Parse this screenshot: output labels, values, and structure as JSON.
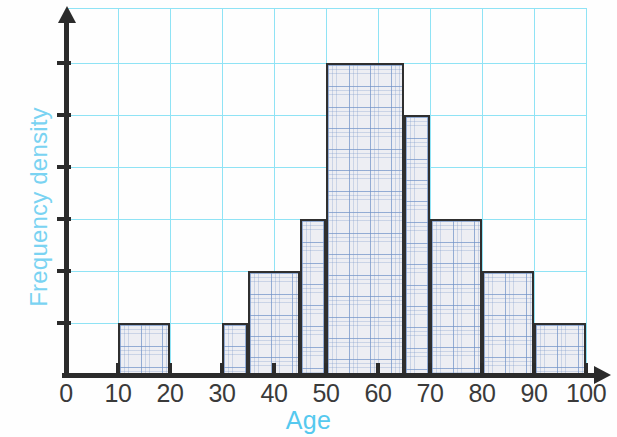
{
  "chart_data": {
    "type": "bar",
    "title": "",
    "subtitle": "",
    "xlabel": "Age",
    "ylabel": "Frequency density",
    "xlim": [
      0,
      100
    ],
    "ylim": [
      0,
      7
    ],
    "grid": true,
    "legend": null,
    "xticks": [
      "0",
      "10",
      "20",
      "30",
      "40",
      "50",
      "60",
      "70",
      "80",
      "90",
      "100"
    ],
    "xtick_values": [
      0,
      10,
      20,
      30,
      40,
      50,
      60,
      70,
      80,
      90,
      100
    ],
    "yticks": [
      "",
      "",
      "",
      "",
      "",
      ""
    ],
    "ytick_values": [
      1,
      2,
      3,
      4,
      5,
      6
    ],
    "bin_edges": [
      10,
      20,
      30,
      35,
      45,
      50,
      65,
      70,
      80,
      90,
      100
    ],
    "bars": [
      {
        "label": "10-20",
        "x0": 10,
        "x1": 20,
        "height": 1
      },
      {
        "label": "30-35",
        "x0": 30,
        "x1": 35,
        "height": 1
      },
      {
        "label": "35-45",
        "x0": 35,
        "x1": 45,
        "height": 2
      },
      {
        "label": "45-50",
        "x0": 45,
        "x1": 50,
        "height": 3
      },
      {
        "label": "50-65",
        "x0": 50,
        "x1": 65,
        "height": 6
      },
      {
        "label": "65-70",
        "x0": 65,
        "x1": 70,
        "height": 5
      },
      {
        "label": "70-80",
        "x0": 70,
        "x1": 80,
        "height": 3
      },
      {
        "label": "80-90",
        "x0": 80,
        "x1": 90,
        "height": 2
      },
      {
        "label": "90-100",
        "x0": 90,
        "x1": 100,
        "height": 1
      }
    ],
    "colors": {
      "grid": "#8fe3f5",
      "axis": "#2b2b2b",
      "bar_edge": "#2f2f2f",
      "bar_fill": "#edeef3",
      "xlabel_color": "#55c9ef",
      "ylabel_color": "#7ad3f2",
      "tick_label_color": "#3a3a3a"
    }
  },
  "axes": {
    "x_title": "Age",
    "y_title": "Frequency density"
  }
}
